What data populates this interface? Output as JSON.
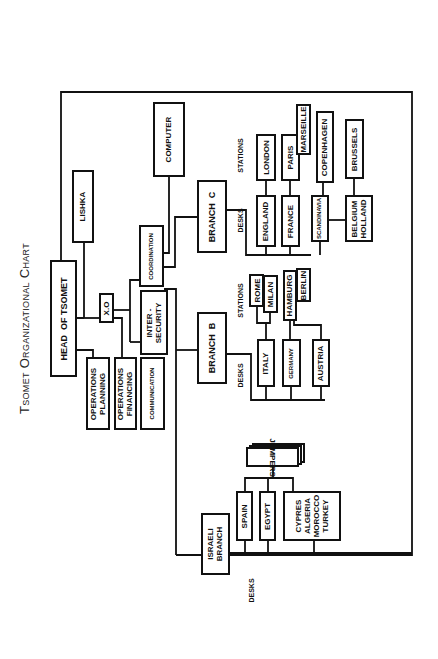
{
  "title": "Tsomet Organizational Chart",
  "headquarters": {
    "head": "HEAD  OF TSOMET",
    "lishka": "LISHKA",
    "xo": "X.O",
    "operations_planning": "OPERATIONS\nPLANNING",
    "operations_financing": "OPERATIONS\nFINANCING",
    "communication": "COMMUNICATION",
    "inter_security": "INTER -\nSECURITY",
    "coordination": "COORDINATION",
    "computer": "COMPUTER"
  },
  "branch_c": {
    "label": "BRANCH  C",
    "desks_label": "DESKS",
    "stations_label": "STATIONS",
    "desks": [
      {
        "desk": "ENGLAND",
        "stations": [
          "LONDON"
        ]
      },
      {
        "desk": "FRANCE",
        "stations": [
          "PARIS",
          "MARSEILLE"
        ]
      },
      {
        "desk": "SCANDINAVIA",
        "stations": [
          "COPENHAGEN"
        ]
      },
      {
        "desk": "BELGIUM\nHOLLAND",
        "stations": [
          "BRUSSELS"
        ]
      }
    ]
  },
  "branch_b": {
    "label": "BRANCH  B",
    "desks_label": "DESKS",
    "stations_label": "STATIONS",
    "desks": [
      {
        "desk": "ITALY",
        "stations": [
          "ROME",
          "MILAN"
        ]
      },
      {
        "desk": "GERMANY",
        "stations": [
          "HAMBURG",
          "BERLIN"
        ]
      },
      {
        "desk": "AUSTRIA",
        "stations": []
      }
    ]
  },
  "israeli_branch": {
    "label": "ISRAELI\nBRANCH",
    "desks_label": "DESKS",
    "jumpers": "JUMPERS",
    "desks": [
      {
        "desk": "SPAIN"
      },
      {
        "desk": "EGYPT"
      },
      {
        "desk": "CYPRES\nALGERIA\nMOROCCO\nTURKEY"
      }
    ]
  },
  "colors": {
    "line": "#111111",
    "background": "#ffffff"
  }
}
